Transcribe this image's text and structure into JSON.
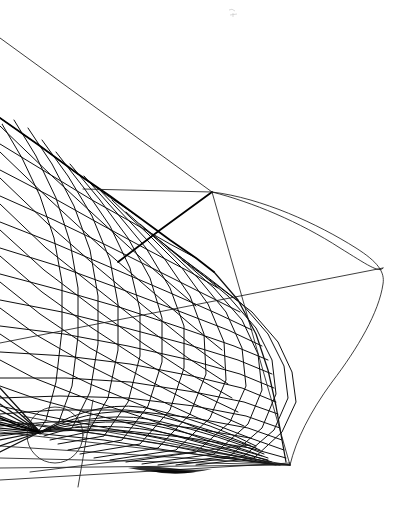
{
  "document": {
    "kind": "technical-line-drawing",
    "subject": "ship-hull-lines-plan",
    "title": "",
    "background_color": "#ffffff",
    "ink_color": "#0d0d0d",
    "canvas": {
      "width": 407,
      "height": 509
    },
    "labels": [],
    "annotations": []
  },
  "chart_data": {
    "type": "line",
    "title": "",
    "subtitle": "",
    "xlabel": "",
    "ylabel": "",
    "grid": false,
    "legend": "none",
    "xlim": [
      0,
      407
    ],
    "ylim": [
      509,
      0
    ],
    "features": {
      "node_point": [
        212,
        192
      ],
      "stem_vertex": [
        290,
        465
      ],
      "bulb_extreme": [
        383,
        265
      ],
      "construction_circle": {
        "cx": 55,
        "cy": 435,
        "r": 28
      },
      "baseline_y": 465,
      "mesh_left_edge_top_y": 118,
      "waterline_spacing_px": 26,
      "smudge_mark": [
        232,
        11
      ]
    },
    "series": [
      {
        "name": "profile-outline",
        "points": [
          [
            212,
            192
          ],
          [
            260,
            200
          ],
          [
            310,
            222
          ],
          [
            350,
            240
          ],
          [
            374,
            258
          ],
          [
            383,
            272
          ],
          [
            376,
            300
          ],
          [
            356,
            340
          ],
          [
            330,
            380
          ],
          [
            306,
            420
          ],
          [
            292,
            452
          ],
          [
            290,
            465
          ]
        ]
      },
      {
        "name": "bulb-lower-curve",
        "points": [
          [
            383,
            268
          ],
          [
            372,
            298
          ],
          [
            352,
            336
          ],
          [
            328,
            374
          ],
          [
            306,
            412
          ],
          [
            292,
            446
          ],
          [
            290,
            465
          ]
        ]
      },
      {
        "name": "deck-edge-waterline",
        "points": [
          [
            83,
            189
          ],
          [
            130,
            190
          ],
          [
            175,
            191
          ],
          [
            212,
            192
          ]
        ]
      },
      {
        "name": "long-diagonal-upper",
        "points": [
          [
            0,
            38
          ],
          [
            106,
            115
          ],
          [
            212,
            192
          ]
        ]
      },
      {
        "name": "station-line-down",
        "points": [
          [
            212,
            192
          ],
          [
            240,
            280
          ],
          [
            266,
            370
          ],
          [
            286,
            440
          ],
          [
            290,
            465
          ]
        ]
      },
      {
        "name": "diagonal-to-mesh",
        "points": [
          [
            212,
            192
          ],
          [
            160,
            230
          ],
          [
            118,
            262
          ]
        ]
      },
      {
        "name": "bulb-chord",
        "points": [
          [
            0,
            343
          ],
          [
            120,
            322
          ],
          [
            250,
            292
          ],
          [
            340,
            276
          ],
          [
            383,
            268
          ]
        ]
      }
    ],
    "waterlines_left_edge_y": [
      118,
      144,
      170,
      196,
      222,
      248,
      274,
      300,
      326,
      352,
      378,
      404,
      424,
      440,
      452
    ],
    "station_count": 26,
    "diagonal_count": 22
  }
}
